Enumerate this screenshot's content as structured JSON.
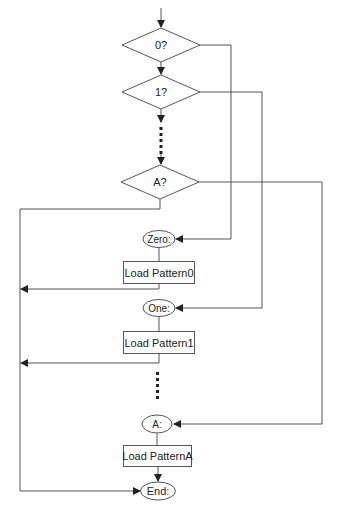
{
  "diagram": {
    "type": "flowchart",
    "decisions": [
      {
        "id": "d0",
        "label": "0?"
      },
      {
        "id": "d1",
        "label": "1?"
      },
      {
        "id": "dA",
        "label": "A?"
      }
    ],
    "labels": [
      {
        "id": "zero",
        "label": "Zero:"
      },
      {
        "id": "one",
        "label": "One:"
      },
      {
        "id": "a",
        "label": "A:"
      },
      {
        "id": "end",
        "label": "End:"
      }
    ],
    "processes": [
      {
        "id": "p0",
        "label": "Load Pattern0"
      },
      {
        "id": "p1",
        "label": "Load Pattern1"
      },
      {
        "id": "pA",
        "label": "Load PatternA"
      }
    ],
    "colors": {
      "line": "#555555",
      "text": "#222222",
      "background": "#ffffff"
    }
  }
}
